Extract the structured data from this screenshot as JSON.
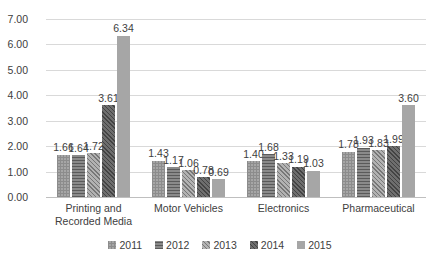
{
  "chart_data": {
    "type": "bar",
    "title": "",
    "subtitle": "",
    "xlabel": "",
    "ylabel": "",
    "ylim": [
      0,
      7
    ],
    "ytick_labels": [
      "7.00",
      "6.00",
      "5.00",
      "4.00",
      "3.00",
      "2.00",
      "1.00",
      "0.00"
    ],
    "ytick_values": [
      7,
      6,
      5,
      4,
      3,
      2,
      1,
      0
    ],
    "grid": true,
    "legend_position": "bottom",
    "categories": [
      "Printing and Recorded Media",
      "Motor Vehicles",
      "Electronics",
      "Pharmaceutical"
    ],
    "category_lines": [
      [
        "Printing and",
        "Recorded Media"
      ],
      [
        "Motor Vehicles"
      ],
      [
        "Electronics"
      ],
      [
        "Pharmaceutical"
      ]
    ],
    "series": [
      {
        "name": "2011",
        "pattern": "checker",
        "color": "#a6a6a6",
        "values": [
          1.66,
          1.43,
          1.4,
          1.78
        ],
        "labels": [
          "1.66",
          "1.43",
          "1.40",
          "1.78"
        ]
      },
      {
        "name": "2012",
        "pattern": "horizontal-lines",
        "color": "#6e6e6e",
        "values": [
          1.64,
          1.17,
          1.68,
          1.93
        ],
        "labels": [
          "1.64",
          "1.17",
          "1.68",
          "1.93"
        ]
      },
      {
        "name": "2013",
        "pattern": "diagonal-hatch-light",
        "color": "#9a9a9a",
        "values": [
          1.72,
          1.06,
          1.33,
          1.83
        ],
        "labels": [
          "1.72",
          "1.06",
          "1.33",
          "1.83"
        ]
      },
      {
        "name": "2014",
        "pattern": "diagonal-hatch-dark",
        "color": "#595959",
        "values": [
          3.61,
          0.78,
          1.19,
          1.99
        ],
        "labels": [
          "3.61",
          "0.78",
          "1.19",
          "1.99"
        ]
      },
      {
        "name": "2015",
        "pattern": "solid",
        "color": "#a6a6a6",
        "values": [
          6.34,
          0.69,
          1.03,
          3.6
        ],
        "labels": [
          "6.34",
          "0.69",
          "1.03",
          "3.60"
        ]
      }
    ],
    "data_labels_shown": true
  },
  "legend": {
    "items": [
      {
        "label": "2011"
      },
      {
        "label": "2012"
      },
      {
        "label": "2013"
      },
      {
        "label": "2014"
      },
      {
        "label": "2015"
      }
    ]
  }
}
